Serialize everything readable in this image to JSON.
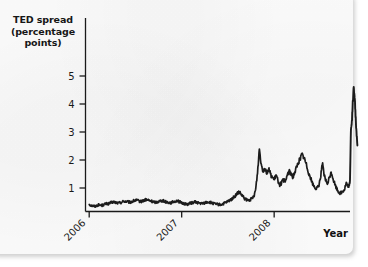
{
  "figure": {
    "background_color": "#fdfdfd",
    "ink_color": "#1a1a1a",
    "series_color": "#1c1c1c"
  },
  "chart_data": {
    "type": "line",
    "title": "",
    "subtitle": "",
    "ylabel": "TED spread\n(percentage\npoints)",
    "ylabel_lines": [
      "TED spread",
      "(percentage",
      "points)"
    ],
    "xlabel": "Year",
    "ylim": [
      0,
      5.6
    ],
    "xlim": [
      2005.96,
      2008.82
    ],
    "yticks": [
      1,
      2,
      3,
      4,
      5
    ],
    "ytick_labels": [
      "1",
      "2",
      "3",
      "4",
      "5"
    ],
    "xticks": [
      2006,
      2007,
      2008
    ],
    "xtick_labels": [
      "2006",
      "2007",
      "2008"
    ],
    "xtick_rotation_deg": 45,
    "grid": false,
    "legend": null,
    "legend_position": "none",
    "series": [
      {
        "name": "TED spread",
        "units": "percentage points",
        "x": [
          2006.0,
          2006.02,
          2006.04,
          2006.06,
          2006.08,
          2006.1,
          2006.12,
          2006.14,
          2006.16,
          2006.18,
          2006.2,
          2006.22,
          2006.24,
          2006.26,
          2006.28,
          2006.3,
          2006.32,
          2006.34,
          2006.36,
          2006.38,
          2006.4,
          2006.42,
          2006.44,
          2006.46,
          2006.48,
          2006.5,
          2006.52,
          2006.54,
          2006.56,
          2006.58,
          2006.6,
          2006.62,
          2006.64,
          2006.66,
          2006.68,
          2006.7,
          2006.72,
          2006.74,
          2006.76,
          2006.78,
          2006.8,
          2006.82,
          2006.84,
          2006.86,
          2006.88,
          2006.9,
          2006.92,
          2006.94,
          2006.96,
          2006.98,
          2007.0,
          2007.02,
          2007.04,
          2007.06,
          2007.08,
          2007.1,
          2007.12,
          2007.14,
          2007.16,
          2007.18,
          2007.2,
          2007.22,
          2007.24,
          2007.26,
          2007.28,
          2007.3,
          2007.32,
          2007.34,
          2007.36,
          2007.38,
          2007.4,
          2007.42,
          2007.44,
          2007.46,
          2007.48,
          2007.5,
          2007.52,
          2007.54,
          2007.56,
          2007.58,
          2007.6,
          2007.62,
          2007.64,
          2007.66,
          2007.68,
          2007.7,
          2007.72,
          2007.74,
          2007.76,
          2007.78,
          2007.8,
          2007.82,
          2007.84,
          2007.86,
          2007.88,
          2007.9,
          2007.92,
          2007.94,
          2007.96,
          2007.98,
          2008.0,
          2008.02,
          2008.04,
          2008.06,
          2008.08,
          2008.1,
          2008.12,
          2008.14,
          2008.16,
          2008.18,
          2008.2,
          2008.22,
          2008.24,
          2008.26,
          2008.28,
          2008.3,
          2008.32,
          2008.34,
          2008.36,
          2008.38,
          2008.4,
          2008.42,
          2008.44,
          2008.46,
          2008.48,
          2008.5,
          2008.52,
          2008.54,
          2008.56,
          2008.58,
          2008.6,
          2008.62,
          2008.64,
          2008.66,
          2008.68,
          2008.7,
          2008.72,
          2008.74,
          2008.76,
          2008.78,
          2008.8
        ],
        "y": [
          0.42,
          0.38,
          0.36,
          0.35,
          0.37,
          0.4,
          0.39,
          0.38,
          0.41,
          0.44,
          0.43,
          0.45,
          0.48,
          0.5,
          0.49,
          0.47,
          0.46,
          0.48,
          0.51,
          0.53,
          0.52,
          0.5,
          0.49,
          0.51,
          0.54,
          0.56,
          0.55,
          0.53,
          0.52,
          0.54,
          0.57,
          0.58,
          0.56,
          0.54,
          0.52,
          0.5,
          0.49,
          0.51,
          0.53,
          0.55,
          0.54,
          0.52,
          0.5,
          0.48,
          0.47,
          0.49,
          0.52,
          0.54,
          0.53,
          0.5,
          0.47,
          0.45,
          0.43,
          0.42,
          0.44,
          0.46,
          0.48,
          0.5,
          0.49,
          0.47,
          0.45,
          0.44,
          0.46,
          0.48,
          0.5,
          0.49,
          0.47,
          0.45,
          0.43,
          0.42,
          0.41,
          0.4,
          0.42,
          0.45,
          0.48,
          0.52,
          0.56,
          0.6,
          0.66,
          0.72,
          0.8,
          0.86,
          0.78,
          0.7,
          0.62,
          0.58,
          0.55,
          0.58,
          0.62,
          0.7,
          0.95,
          1.55,
          2.4,
          1.85,
          1.62,
          1.72,
          1.55,
          1.68,
          1.5,
          1.38,
          1.3,
          1.45,
          1.28,
          1.12,
          1.18,
          1.3,
          1.2,
          1.45,
          1.62,
          1.5,
          1.38,
          1.55,
          1.72,
          1.9,
          2.05,
          2.2,
          2.1,
          1.92,
          1.7,
          1.48,
          1.3,
          1.12,
          1.02,
          0.98,
          1.05,
          1.35,
          1.9,
          1.45,
          1.25,
          1.15,
          1.42,
          1.55,
          1.3,
          1.1,
          0.95,
          0.85,
          0.82,
          0.88,
          0.95,
          1.18,
          1.05
        ]
      },
      {
        "name": "TED spread (crisis tail)",
        "units": "percentage points",
        "x": [
          2008.8,
          2008.81,
          2008.82,
          2008.83,
          2008.84,
          2008.85,
          2008.86,
          2008.87,
          2008.88,
          2008.89,
          2008.9
        ],
        "y": [
          1.05,
          1.1,
          1.25,
          3.05,
          3.35,
          4.05,
          4.58,
          4.3,
          3.6,
          2.95,
          2.52
        ]
      }
    ],
    "annotations": [
      {
        "text": "peak",
        "value": 4.6,
        "approx_date": "2008 Q4"
      },
      {
        "text": "first spike",
        "value": 2.4,
        "approx_date": "2007 Aug"
      }
    ]
  }
}
